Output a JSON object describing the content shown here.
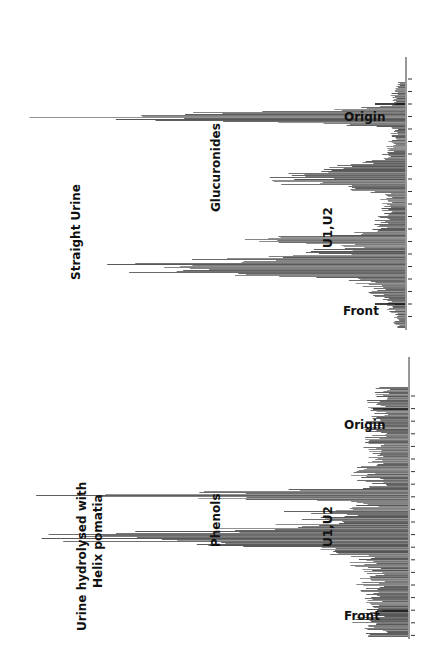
{
  "figure": {
    "panels": [
      {
        "id": "straight",
        "title": "Straight Urine",
        "peak_label": "Glucuronides",
        "secondary_label": "U1,U2",
        "origin_label": "Origin",
        "front_label": "Front"
      },
      {
        "id": "hydrolysed",
        "title_line1": "Urine hydrolysed with",
        "title_line2": "Helix pomatia",
        "peak_label": "Phenols",
        "secondary_label": "U1,U2",
        "origin_label": "Origin",
        "front_label": "Front"
      }
    ],
    "colors": {
      "bars": "#555555",
      "axis": "#333333",
      "marker": "#111111",
      "background": "#ffffff"
    }
  },
  "chart_data": [
    {
      "type": "bar",
      "orientation": "horizontal (rotated radiochromatogram; bars extend left from baseline)",
      "title": "Straight Urine",
      "xlabel": "Position along chromatogram (Front → Origin)",
      "ylabel": "Radioactivity (relative counts)",
      "markers": [
        "Origin",
        "Front"
      ],
      "annotations": [
        "Glucuronides (main peak near origin)",
        "U1,U2 (secondary peak)"
      ],
      "categories_relative_position": [
        0.0,
        0.05,
        0.1,
        0.15,
        0.2,
        0.25,
        0.3,
        0.35,
        0.4,
        0.45,
        0.5,
        0.55,
        0.6,
        0.65,
        0.7,
        0.75,
        0.8,
        0.85,
        0.9,
        0.95,
        1.0
      ],
      "values_relative": [
        2,
        3,
        5,
        8,
        14,
        100,
        25,
        12,
        8,
        6,
        5,
        6,
        35,
        18,
        6,
        4,
        3,
        3,
        4,
        3,
        2
      ],
      "grid": false,
      "legend": "none"
    },
    {
      "type": "bar",
      "orientation": "horizontal (rotated radiochromatogram; bars extend left from baseline)",
      "title": "Urine hydrolysed with Helix pomatia",
      "xlabel": "Position along chromatogram (Front → Origin)",
      "ylabel": "Radioactivity (relative counts)",
      "markers": [
        "Origin",
        "Front"
      ],
      "annotations": [
        "Phenols (main peak)",
        "U1,U2 (secondary peak)"
      ],
      "categories_relative_position": [
        0.0,
        0.05,
        0.1,
        0.15,
        0.2,
        0.25,
        0.3,
        0.35,
        0.4,
        0.45,
        0.5,
        0.55,
        0.6,
        0.65,
        0.7,
        0.75,
        0.8,
        0.85,
        0.9,
        0.95,
        1.0
      ],
      "values_relative": [
        8,
        12,
        10,
        9,
        11,
        10,
        14,
        18,
        100,
        30,
        12,
        10,
        9,
        12,
        10,
        11,
        9,
        10,
        8,
        9,
        7
      ],
      "grid": false,
      "legend": "none"
    }
  ]
}
